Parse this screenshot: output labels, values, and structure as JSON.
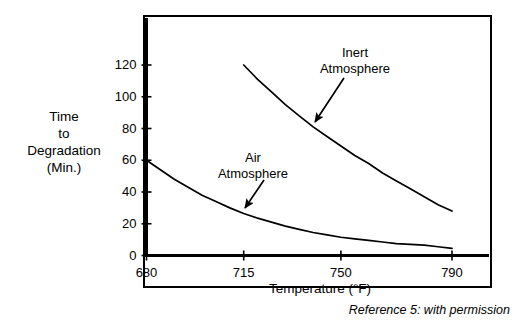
{
  "chart_data": {
    "type": "line",
    "title": "",
    "xlabel": "Temperature (°F)",
    "ylabel": "Time to Degradation (Min.)",
    "ylabel_lines": [
      "Time",
      "to",
      "Degradation",
      "(Min.)"
    ],
    "xlim": [
      680,
      790
    ],
    "ylim": [
      0,
      130
    ],
    "xticks": [
      680,
      715,
      750,
      790
    ],
    "xtick_labels": [
      "680",
      "715",
      "750",
      "790"
    ],
    "yticks": [
      0,
      20,
      40,
      60,
      80,
      100,
      120
    ],
    "ytick_labels": [
      "0",
      "20",
      "40",
      "60",
      "80",
      "100",
      "120"
    ],
    "grid": false,
    "legend": "none",
    "annotations": [
      {
        "name": "inert-atmosphere",
        "lines": [
          "Inert",
          "Atmosphere"
        ],
        "text": "Inert Atmosphere",
        "points_to": [
          737,
          78
        ]
      },
      {
        "name": "air-atmosphere",
        "lines": [
          "Air",
          "Atmosphere"
        ],
        "text": "Air Atmosphere",
        "points_to": [
          715,
          26
        ]
      }
    ],
    "series": [
      {
        "name": "Inert Atmosphere",
        "color": "#000000",
        "x": [
          715,
          720,
          725,
          730,
          735,
          740,
          745,
          750,
          755,
          760,
          765,
          770,
          775,
          780,
          785,
          790
        ],
        "values": [
          120,
          111,
          103,
          95,
          88,
          81,
          75,
          69,
          63,
          58,
          52,
          47,
          42,
          37,
          32,
          28
        ]
      },
      {
        "name": "Air Atmosphere",
        "color": "#000000",
        "x": [
          680,
          685,
          690,
          695,
          700,
          705,
          710,
          715,
          720,
          725,
          730,
          735,
          740,
          745,
          750,
          755,
          760,
          765,
          770,
          775,
          780,
          785,
          790
        ],
        "values": [
          60,
          54,
          48,
          43,
          38,
          34,
          30,
          26.5,
          23.5,
          21,
          18.5,
          16.5,
          14.5,
          13,
          11.5,
          10.5,
          9.5,
          8.5,
          7.5,
          7,
          6.5,
          5.5,
          4.5
        ]
      }
    ]
  },
  "caption": {
    "reference": "Reference 5: with permission"
  },
  "colors": {
    "line": "#000000",
    "frame": "#000000",
    "background": "#ffffff",
    "text": "#000000"
  }
}
